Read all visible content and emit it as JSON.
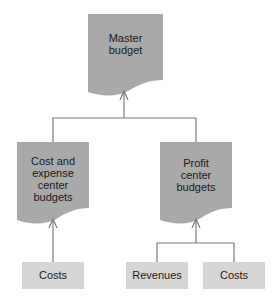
{
  "diagram": {
    "colors": {
      "document_fill": "#a9a9a9",
      "box_fill": "#d6d6d6",
      "line": "#7a7a7a",
      "text": "#1a1a1a"
    },
    "nodes": {
      "master": {
        "label_line1": "Master",
        "label_line2": "budget"
      },
      "cost_expense": {
        "label_line1": "Cost and",
        "label_line2": "expense",
        "label_line3": "center",
        "label_line4": "budgets"
      },
      "profit": {
        "label_line1": "Profit",
        "label_line2": "center",
        "label_line3": "budgets"
      },
      "costs_left": {
        "label": "Costs"
      },
      "revenues": {
        "label": "Revenues"
      },
      "costs_right": {
        "label": "Costs"
      }
    },
    "edges": [
      {
        "from": "cost_expense",
        "to": "master"
      },
      {
        "from": "profit",
        "to": "master"
      },
      {
        "from": "costs_left",
        "to": "cost_expense"
      },
      {
        "from": "revenues",
        "to": "profit"
      },
      {
        "from": "costs_right",
        "to": "profit"
      }
    ]
  }
}
